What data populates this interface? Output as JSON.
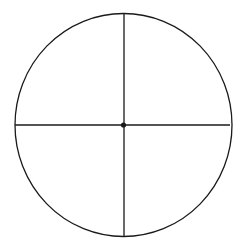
{
  "diagram": {
    "type": "circle-with-crosshair",
    "background": "#ffffff",
    "stroke_color": "#1a1a1a",
    "circle": {
      "cx": 123.5,
      "cy": 125,
      "rx": 108.5,
      "ry": 111.5,
      "stroke_width": 1.3
    },
    "horizontal_diameter": {
      "x1": 15,
      "y1": 125,
      "x2": 230,
      "y2": 125,
      "stroke_width": 1.3
    },
    "vertical_diameter": {
      "x1": 124,
      "y1": 13.5,
      "x2": 124,
      "y2": 236.5,
      "stroke_width": 1.3
    },
    "center_point": {
      "cx": 123.5,
      "cy": 125,
      "r": 2.6
    }
  }
}
